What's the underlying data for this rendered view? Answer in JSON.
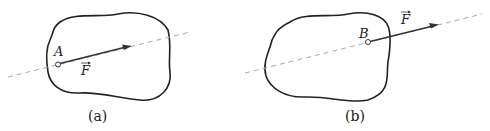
{
  "figure": {
    "panels": [
      {
        "id": "a",
        "caption": "(a)",
        "point_label": "A",
        "force_label": "F",
        "force_vector_note": "vector arrow over F"
      },
      {
        "id": "b",
        "caption": "(b)",
        "point_label": "B",
        "force_label": "F",
        "force_vector_note": "vector arrow over F"
      }
    ],
    "colors": {
      "outline": "#222222",
      "dashed_line": "#aaaaaa",
      "arrow": "#333333"
    }
  }
}
